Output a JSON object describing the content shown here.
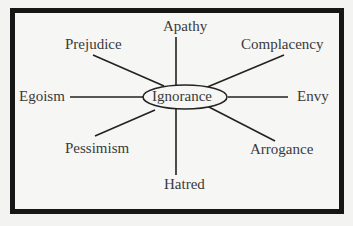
{
  "diagram": {
    "center": "Ignorance",
    "spokes": [
      {
        "id": "apathy",
        "label": "Apathy"
      },
      {
        "id": "complacency",
        "label": "Complacency"
      },
      {
        "id": "envy",
        "label": "Envy"
      },
      {
        "id": "arrogance",
        "label": "Arrogance"
      },
      {
        "id": "hatred",
        "label": "Hatred"
      },
      {
        "id": "pessimism",
        "label": "Pessimism"
      },
      {
        "id": "egoism",
        "label": "Egoism"
      },
      {
        "id": "prejudice",
        "label": "Prejudice"
      }
    ],
    "colors": {
      "border": "#161616",
      "line": "#222222",
      "text": "#3a3a3a",
      "background": "#f6f6f4"
    }
  }
}
